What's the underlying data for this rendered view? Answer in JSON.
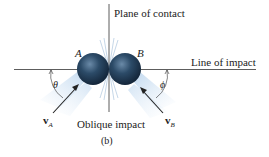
{
  "figure": {
    "labels": {
      "plane_of_contact": "Plane of contact",
      "line_of_impact": "Line of impact",
      "ball_a": "A",
      "ball_b": "B",
      "theta": "θ",
      "phi": "ϕ",
      "velocity_a": "v",
      "velocity_a_sub": "A",
      "velocity_b": "v",
      "velocity_b_sub": "B",
      "caption": "Oblique impact",
      "subfigure": "(b)"
    },
    "colors": {
      "ball": "#2a4560",
      "glow": "#a9c8e6",
      "line": "#333333"
    }
  }
}
